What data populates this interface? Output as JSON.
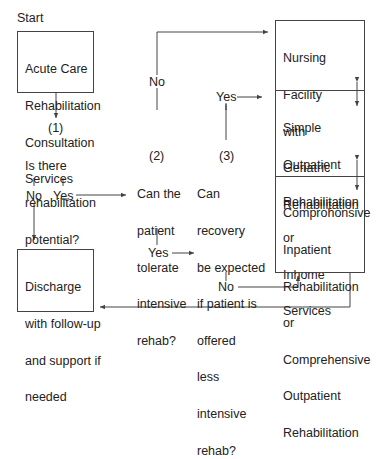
{
  "start_label": "Start",
  "nodes": {
    "acute_care": [
      "Acute Care",
      "Rehabilitation",
      "Consultation",
      "Services"
    ],
    "discharge": [
      "Discharge",
      "with follow-up",
      "and support if",
      "needed"
    ],
    "nursing": [
      "Nursing",
      "Facility",
      "with",
      "Geriatric",
      "Rehabilitation"
    ],
    "simple_outpatient": [
      "Simple",
      "Outpatient",
      "Rehabilitation",
      "or",
      "Inhome",
      "Services"
    ],
    "comprehensive": [
      "Comprohonsive",
      "Inpatient",
      "Rehabilitation",
      "or",
      "Comprehensive",
      "Outpatient",
      "Rehabilitation"
    ]
  },
  "questions": {
    "q1": {
      "number": "(1)",
      "lines": [
        "Is there",
        "rehabilitation",
        "potential?"
      ]
    },
    "q2": {
      "number": "(2)",
      "lines": [
        "Can the",
        "patient",
        "tolerate",
        "intensive",
        "rehab?"
      ]
    },
    "q3": {
      "number": "(3)",
      "lines": [
        "Can",
        "recovery",
        "be expected",
        "if patient is",
        "offered",
        "less",
        "intensive",
        "rehab?"
      ]
    }
  },
  "edge_labels": {
    "q1_no": "No",
    "q1_yes": "Yes",
    "q2_no": "No",
    "q2_yes": "Yes",
    "q3_yes": "Yes",
    "q3_no": "No"
  },
  "colors": {
    "line": "#444444",
    "text": "#222222",
    "background": "#ffffff"
  }
}
